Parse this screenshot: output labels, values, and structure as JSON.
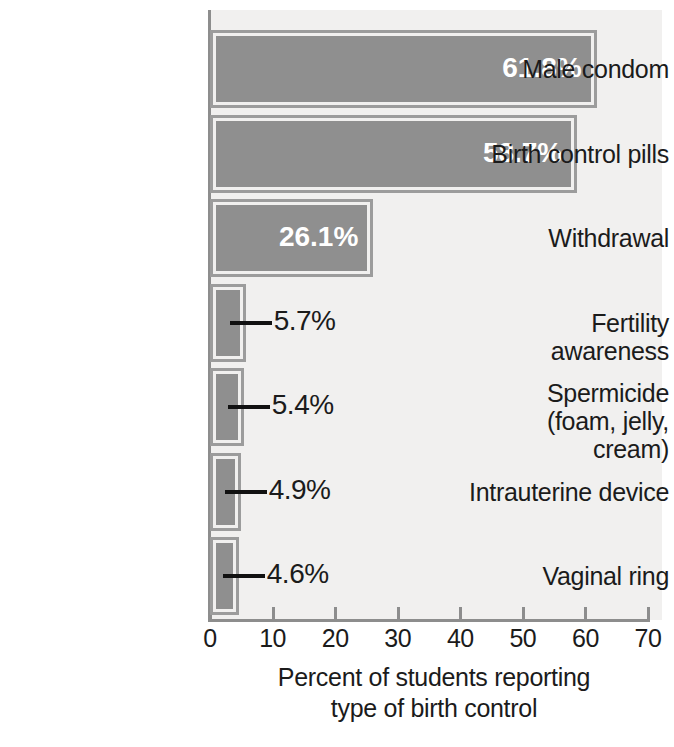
{
  "chart_data": {
    "type": "bar",
    "orientation": "horizontal",
    "title": "",
    "xlabel_line1": "Percent of students reporting",
    "xlabel_line2": "type of birth control",
    "ylabel": "",
    "xlim": [
      0,
      70
    ],
    "xticks": [
      0,
      10,
      20,
      30,
      40,
      50,
      60,
      70
    ],
    "xtick_labels": [
      "0",
      "10",
      "20",
      "30",
      "40",
      "50",
      "60",
      "70"
    ],
    "grid": false,
    "legend": "none",
    "categories": [
      "Male condom",
      "Birth control pills",
      "Withdrawal",
      "Fertility awareness",
      "Spermicide\n(foam, jelly, cream)",
      "Intrauterine device",
      "Vaginal ring"
    ],
    "category_lines": [
      [
        "Male condom"
      ],
      [
        "Birth control pills"
      ],
      [
        "Withdrawal"
      ],
      [
        "Fertility awareness"
      ],
      [
        "Spermicide",
        "(foam, jelly, cream)"
      ],
      [
        "Intrauterine device"
      ],
      [
        "Vaginal ring"
      ]
    ],
    "values": [
      61.8,
      58.7,
      26.1,
      5.7,
      5.4,
      4.9,
      4.6
    ],
    "value_labels": [
      "61.8%",
      "58.7%",
      "26.1%",
      "5.7%",
      "5.4%",
      "4.9%",
      "4.6%"
    ],
    "label_placement": [
      "inside",
      "inside",
      "inside",
      "outside",
      "outside",
      "outside",
      "outside"
    ]
  },
  "colors": {
    "bar_fill": "#8f8f8f",
    "bar_border": "#9c9c9c",
    "plot_background": "#f1f0ef",
    "page_background": "#ffffff",
    "axis": "#8d8d8d",
    "text": "#1b1b1b",
    "inside_label_text": "#ffffff",
    "leader_line": "#111111"
  }
}
